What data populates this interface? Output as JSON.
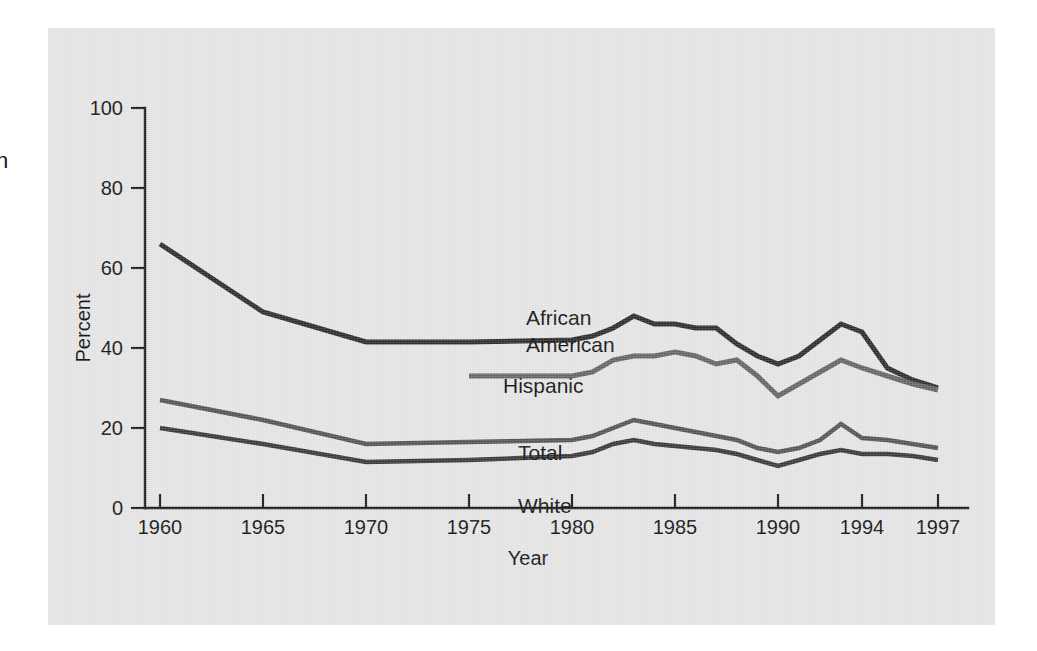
{
  "margin_fragment": "n",
  "chart_data": {
    "type": "line",
    "title": "",
    "xlabel": "Year",
    "ylabel": "Percent",
    "ylim": [
      0,
      100
    ],
    "yticks": [
      0,
      20,
      40,
      60,
      80,
      100
    ],
    "ytick_labels": [
      "0",
      "20",
      "40",
      "60",
      "80",
      "100"
    ],
    "xtick_labels": [
      "1960",
      "1965",
      "1970",
      "1975",
      "1980",
      "1985",
      "1990",
      "1994",
      "1997"
    ],
    "xtick_years": [
      1960,
      1965,
      1970,
      1975,
      1980,
      1985,
      1990,
      1994,
      1997
    ],
    "grid": false,
    "legend": "inline-labels",
    "series": [
      {
        "name": "African American",
        "label": "African American",
        "label_lines": [
          "African",
          "American"
        ],
        "color": "#2e2e2e",
        "width": 5,
        "x": [
          1960,
          1965,
          1970,
          1975,
          1980,
          1981,
          1982,
          1983,
          1984,
          1985,
          1986,
          1987,
          1988,
          1989,
          1990,
          1991,
          1992,
          1993,
          1994,
          1995,
          1996,
          1997
        ],
        "values": [
          66,
          49,
          41.5,
          41.5,
          42,
          43,
          45,
          48,
          46,
          46,
          45,
          45,
          41,
          38,
          36,
          38,
          42,
          46,
          44,
          35,
          32,
          30
        ]
      },
      {
        "name": "Hispanic",
        "label": "Hispanic",
        "label_lines": [
          "Hispanic"
        ],
        "color": "#666666",
        "width": 5,
        "x": [
          1975,
          1980,
          1981,
          1982,
          1983,
          1984,
          1985,
          1986,
          1987,
          1988,
          1989,
          1990,
          1991,
          1992,
          1993,
          1994,
          1995,
          1996,
          1997
        ],
        "values": [
          33,
          33,
          34,
          37,
          38,
          38,
          39,
          38,
          36,
          37,
          33,
          28,
          31,
          34,
          37,
          35,
          33,
          31,
          29.5
        ]
      },
      {
        "name": "Total",
        "label": "Total",
        "label_lines": [
          "Total"
        ],
        "color": "#555555",
        "width": 4.5,
        "x": [
          1960,
          1965,
          1970,
          1975,
          1980,
          1981,
          1982,
          1983,
          1984,
          1985,
          1986,
          1987,
          1988,
          1989,
          1990,
          1991,
          1992,
          1993,
          1994,
          1995,
          1996,
          1997
        ],
        "values": [
          27,
          22,
          16,
          16.5,
          17,
          18,
          20,
          22,
          21,
          20,
          19,
          18,
          17,
          15,
          14,
          15,
          17,
          21,
          17.5,
          17,
          16,
          15
        ]
      },
      {
        "name": "White",
        "label": "White",
        "label_lines": [
          "White"
        ],
        "color": "#3a3a3a",
        "width": 4.5,
        "x": [
          1960,
          1965,
          1970,
          1975,
          1980,
          1981,
          1982,
          1983,
          1984,
          1985,
          1986,
          1987,
          1988,
          1989,
          1990,
          1991,
          1992,
          1993,
          1994,
          1995,
          1996,
          1997
        ],
        "values": [
          20,
          16,
          11.5,
          12,
          13,
          14,
          16,
          17,
          16,
          15.5,
          15,
          14.5,
          13.5,
          12,
          10.5,
          12,
          13.5,
          14.5,
          13.5,
          13.5,
          13,
          12
        ]
      }
    ],
    "series_label_positions": [
      {
        "name": "African American",
        "x": 478,
        "y": 297
      },
      {
        "name": "Hispanic",
        "x": 455,
        "y": 365
      },
      {
        "name": "Total",
        "x": 470,
        "y": 432
      },
      {
        "name": "White",
        "x": 470,
        "y": 485
      }
    ]
  }
}
